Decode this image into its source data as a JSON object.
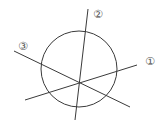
{
  "diagram": {
    "stroke_color": "#3a3a3a",
    "label_color": "#555555",
    "circle": {
      "cx": 79,
      "cy": 69,
      "r": 38
    },
    "lines": [
      {
        "id": "1",
        "label": "①",
        "x1": 25,
        "y1": 100,
        "x2": 137,
        "y2": 65,
        "label_x": 150,
        "label_y": 65
      },
      {
        "id": "2",
        "label": "②",
        "x1": 75,
        "y1": 120,
        "x2": 88,
        "y2": 9,
        "label_x": 98,
        "label_y": 18
      },
      {
        "id": "3",
        "label": "③",
        "x1": 14,
        "y1": 51,
        "x2": 130,
        "y2": 107,
        "label_x": 23,
        "label_y": 50
      }
    ]
  }
}
